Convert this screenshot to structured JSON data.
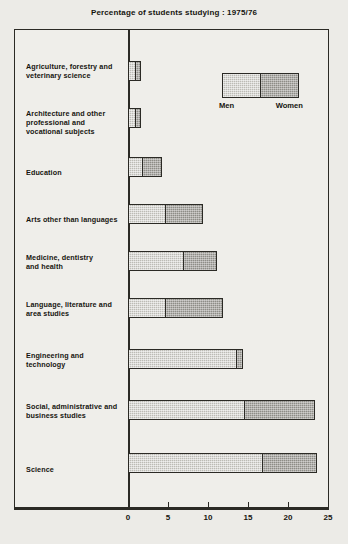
{
  "chart_data": {
    "type": "bar",
    "orientation": "horizontal",
    "stacked": true,
    "title": "Percentage of students studying : 1975/76",
    "xlabel": "",
    "ylabel": "",
    "xlim": [
      0,
      25
    ],
    "xticks": [
      0,
      5,
      10,
      15,
      20,
      25
    ],
    "xtick_labels": [
      "0",
      "5",
      "10",
      "15",
      "20",
      "25"
    ],
    "grid": false,
    "legend_position": "top-right-inside",
    "categories": [
      "Agriculture, forestry and veterinary science",
      "Architecture and other professional and vocational subjects",
      "Education",
      "Arts other than languages",
      "Medicine, dentistry and health",
      "Language, literature and area studies",
      "Engineering and technology",
      "Social, administrative and business studies",
      "Science"
    ],
    "series": [
      {
        "name": "Men",
        "color": "#bcbbb5",
        "values": [
          1.0,
          1.0,
          1.9,
          4.8,
          7.0,
          4.8,
          13.6,
          14.7,
          16.9
        ]
      },
      {
        "name": "Women",
        "color": "#8e8d87",
        "values": [
          0.6,
          0.6,
          2.4,
          4.6,
          4.1,
          7.1,
          0.8,
          8.7,
          6.7
        ]
      }
    ],
    "totals": [
      1.6,
      1.6,
      4.3,
      9.4,
      11.1,
      11.9,
      14.4,
      23.4,
      23.6
    ]
  },
  "labels": {
    "cat_0": "Agriculture, forestry and\nveterinary science",
    "cat_1": "Architecture and other\nprofessional and\nvocational subjects",
    "cat_2": "Education",
    "cat_3": "Arts other than languages",
    "cat_4": "Medicine, dentistry\nand health",
    "cat_5": "Language, literature and\narea studies",
    "cat_6": "Engineering and\ntechnology",
    "cat_7": "Social, administrative and\nbusiness studies",
    "cat_8": "Science"
  },
  "legend": {
    "men_label": "Men",
    "women_label": "Women"
  }
}
